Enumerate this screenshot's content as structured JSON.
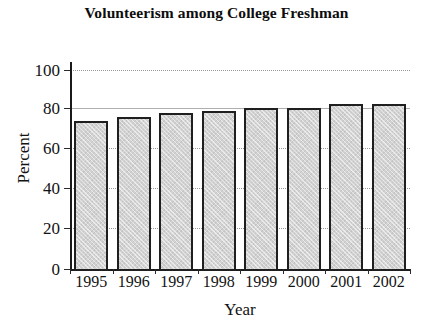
{
  "chart_data": {
    "type": "bar",
    "title": "Volunteerism among College Freshman",
    "xlabel": "Year",
    "ylabel": "Percent",
    "categories": [
      "1995",
      "1996",
      "1997",
      "1998",
      "1999",
      "2000",
      "2001",
      "2002"
    ],
    "values": [
      75,
      77,
      79,
      80,
      81.5,
      81.5,
      83.5,
      83.5
    ],
    "ylim": [
      0,
      100
    ],
    "yticks": [
      0,
      20,
      40,
      60,
      80,
      100
    ],
    "ytick_labels": [
      "0",
      "20",
      "40",
      "60",
      "80",
      "100"
    ],
    "grid": true,
    "grid_style": "dotted",
    "legend": null,
    "bar_fill_color": "#d2d2d2",
    "bar_edge_color": "#1f1f1f",
    "axis_color": "#1a1a1a",
    "grid_color": "#9a9a9a",
    "text_color": "#131313",
    "background_color": "#ffffff"
  }
}
